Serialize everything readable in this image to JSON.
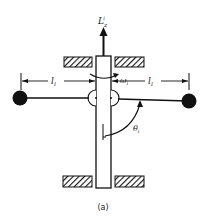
{
  "figure": {
    "caption": "(a)",
    "labels": {
      "angular_momentum": "L",
      "angular_momentum_sub": "z",
      "angular_momentum_sup": "i",
      "omega": "ω",
      "omega_sub": "i",
      "length_left": "l",
      "length_left_sub": "I",
      "length_right": "l",
      "length_right_sub": "I",
      "theta": "θ",
      "theta_sub": "i"
    },
    "colors": {
      "ink": "#111111",
      "background": "#ffffff"
    }
  }
}
